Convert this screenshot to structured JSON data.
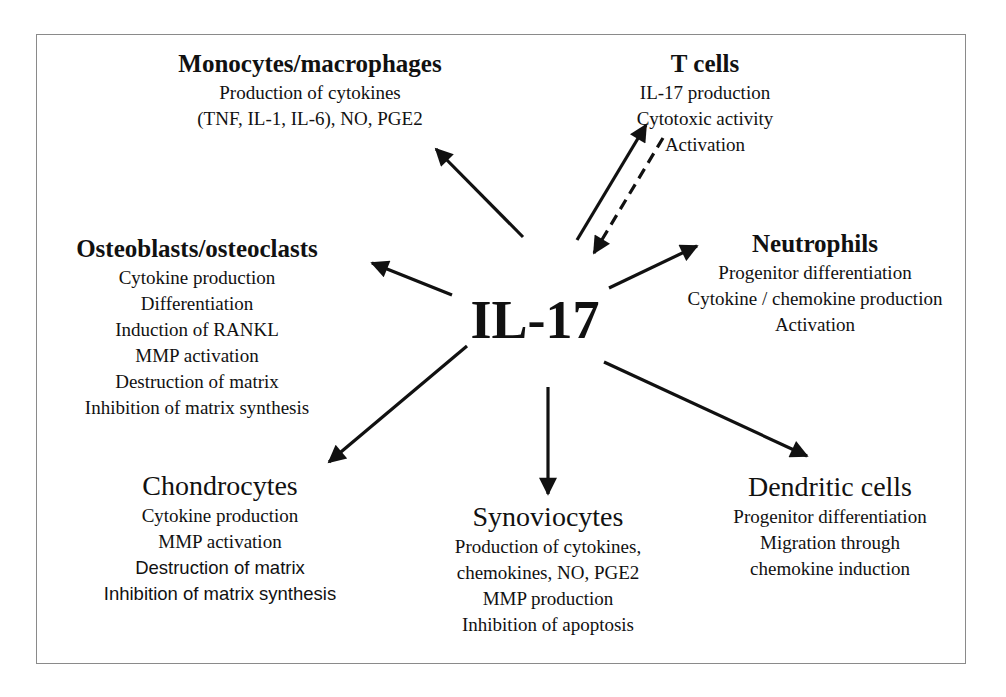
{
  "diagram": {
    "center_label": "IL-17",
    "nodes": {
      "monocytes": {
        "title": "Monocytes/macrophages",
        "lines": [
          "Production of cytokines",
          "(TNF, IL-1, IL-6), NO, PGE2"
        ]
      },
      "t_cells": {
        "title": "T cells",
        "lines": [
          "IL-17 production",
          "Cytotoxic activity",
          "Activation"
        ]
      },
      "osteoblasts": {
        "title": "Osteoblasts/osteoclasts",
        "lines": [
          "Cytokine production",
          "Differentiation",
          "Induction of RANKL",
          "MMP activation",
          "Destruction of matrix",
          "Inhibition of matrix synthesis"
        ]
      },
      "neutrophils": {
        "title": "Neutrophils",
        "lines": [
          "Progenitor differentiation",
          "Cytokine / chemokine production",
          "Activation"
        ]
      },
      "chondrocytes": {
        "title": "Chondrocytes",
        "lines": [
          "Cytokine production",
          "MMP activation",
          "Destruction of matrix",
          "Inhibition of matrix synthesis"
        ]
      },
      "synoviocytes": {
        "title": "Synoviocytes",
        "lines": [
          "Production of cytokines,",
          "chemokines, NO, PGE2",
          "MMP production",
          "Inhibition of apoptosis"
        ]
      },
      "dendritic": {
        "title": "Dendritic cells",
        "lines": [
          "Progenitor differentiation",
          "Migration through",
          "chemokine induction"
        ]
      }
    },
    "edges": [
      {
        "from": "IL-17",
        "to": "Monocytes/macrophages",
        "style": "solid"
      },
      {
        "from": "IL-17",
        "to": "T cells",
        "style": "solid"
      },
      {
        "from": "T cells",
        "to": "IL-17",
        "style": "dashed"
      },
      {
        "from": "IL-17",
        "to": "Osteoblasts/osteoclasts",
        "style": "solid"
      },
      {
        "from": "IL-17",
        "to": "Neutrophils",
        "style": "solid"
      },
      {
        "from": "IL-17",
        "to": "Chondrocytes",
        "style": "solid"
      },
      {
        "from": "IL-17",
        "to": "Synoviocytes",
        "style": "solid"
      },
      {
        "from": "IL-17",
        "to": "Dendritic cells",
        "style": "solid"
      }
    ],
    "colors": {
      "stroke": "#111111",
      "frame": "#8a8a8a",
      "background": "#ffffff"
    }
  }
}
